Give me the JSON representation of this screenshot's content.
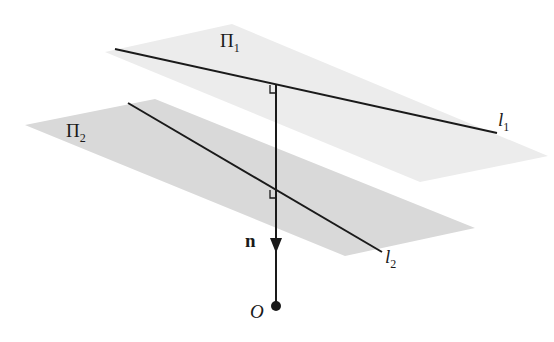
{
  "diagram": {
    "colors": {
      "background": "#ffffff",
      "plane_upper": "#ececec",
      "plane_lower": "#d9d9d9",
      "line": "#1a1a1a"
    },
    "planes": [
      {
        "id": "pi1",
        "label": "Π",
        "subscript": "1",
        "points": "105,52 232,24 548,156 420,182"
      },
      {
        "id": "pi2",
        "label": "Π",
        "subscript": "2",
        "points": "25,125 155,99 475,228 345,256"
      }
    ],
    "lines": [
      {
        "id": "l1",
        "label": "l",
        "subscript": "1",
        "x1": 115,
        "y1": 49,
        "x2": 497,
        "y2": 133
      },
      {
        "id": "l2",
        "label": "l",
        "subscript": "2",
        "x1": 128,
        "y1": 103,
        "x2": 382,
        "y2": 252
      }
    ],
    "normal": {
      "label": "n",
      "x": 276,
      "y1": 84,
      "y2": 306,
      "arrow_y": 250
    },
    "origin": {
      "label": "O",
      "x": 276,
      "y": 306
    },
    "right_angle_marks": [
      {
        "at": "l1-normal",
        "x": 276,
        "y": 84
      },
      {
        "at": "l2-normal",
        "x": 276,
        "y": 190
      }
    ]
  }
}
